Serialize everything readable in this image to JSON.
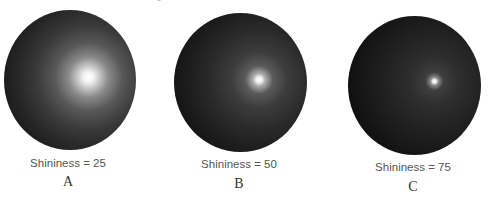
{
  "figure": {
    "panels": [
      {
        "id": "A",
        "caption": "Shininess = 25",
        "letter": "A",
        "shininess": 25
      },
      {
        "id": "B",
        "caption": "Shininess = 50",
        "letter": "B",
        "shininess": 50
      },
      {
        "id": "C",
        "caption": "Shininess = 75",
        "letter": "C",
        "shininess": 75
      }
    ]
  }
}
